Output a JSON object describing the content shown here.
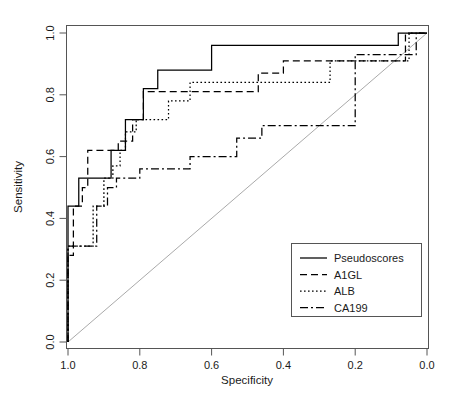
{
  "chart_data": {
    "type": "line",
    "title": "",
    "xlabel": "Specificity",
    "ylabel": "Sensitivity",
    "xlim": [
      1.0,
      0.0
    ],
    "ylim": [
      0.0,
      1.0
    ],
    "x_reversed": true,
    "grid": false,
    "legend_position": "bottom-right",
    "xticks": [
      "1.0",
      "0.8",
      "0.6",
      "0.4",
      "0.2",
      "0.0"
    ],
    "xtick_values": [
      1.0,
      0.8,
      0.6,
      0.4,
      0.2,
      0.0
    ],
    "yticks": [
      "0.0",
      "0.2",
      "0.4",
      "0.6",
      "0.8",
      "1.0"
    ],
    "ytick_values": [
      0.0,
      0.2,
      0.4,
      0.6,
      0.8,
      1.0
    ],
    "reference_line": {
      "name": "chance-diagonal",
      "from": [
        1.0,
        0.0
      ],
      "to": [
        0.0,
        1.0
      ],
      "color": "#aaaaaa"
    },
    "series": [
      {
        "name": "Pseudoscores",
        "style": "solid",
        "dasharray": "none",
        "color": "#000000",
        "points": [
          [
            1.0,
            0.0
          ],
          [
            1.0,
            0.44
          ],
          [
            0.97,
            0.44
          ],
          [
            0.97,
            0.53
          ],
          [
            0.88,
            0.53
          ],
          [
            0.88,
            0.62
          ],
          [
            0.84,
            0.62
          ],
          [
            0.84,
            0.72
          ],
          [
            0.79,
            0.72
          ],
          [
            0.79,
            0.82
          ],
          [
            0.75,
            0.82
          ],
          [
            0.75,
            0.88
          ],
          [
            0.6,
            0.88
          ],
          [
            0.6,
            0.96
          ],
          [
            0.08,
            0.96
          ],
          [
            0.08,
            1.0
          ],
          [
            0.0,
            1.0
          ]
        ]
      },
      {
        "name": "A1GL",
        "style": "dashed",
        "dasharray": "7,4",
        "color": "#000000",
        "points": [
          [
            1.0,
            0.0
          ],
          [
            1.0,
            0.28
          ],
          [
            0.985,
            0.28
          ],
          [
            0.985,
            0.44
          ],
          [
            0.96,
            0.44
          ],
          [
            0.96,
            0.5
          ],
          [
            0.945,
            0.5
          ],
          [
            0.945,
            0.62
          ],
          [
            0.86,
            0.62
          ],
          [
            0.86,
            0.65
          ],
          [
            0.82,
            0.65
          ],
          [
            0.82,
            0.72
          ],
          [
            0.79,
            0.72
          ],
          [
            0.79,
            0.81
          ],
          [
            0.47,
            0.81
          ],
          [
            0.47,
            0.87
          ],
          [
            0.4,
            0.87
          ],
          [
            0.4,
            0.91
          ],
          [
            0.06,
            0.91
          ],
          [
            0.06,
            1.0
          ],
          [
            0.0,
            1.0
          ]
        ]
      },
      {
        "name": "ALB",
        "style": "dotted",
        "dasharray": "1.6,2.4",
        "color": "#000000",
        "points": [
          [
            1.0,
            0.0
          ],
          [
            1.0,
            0.31
          ],
          [
            0.93,
            0.31
          ],
          [
            0.93,
            0.44
          ],
          [
            0.9,
            0.44
          ],
          [
            0.9,
            0.53
          ],
          [
            0.875,
            0.53
          ],
          [
            0.875,
            0.57
          ],
          [
            0.855,
            0.57
          ],
          [
            0.855,
            0.62
          ],
          [
            0.84,
            0.62
          ],
          [
            0.84,
            0.68
          ],
          [
            0.81,
            0.68
          ],
          [
            0.81,
            0.72
          ],
          [
            0.72,
            0.72
          ],
          [
            0.72,
            0.78
          ],
          [
            0.66,
            0.78
          ],
          [
            0.66,
            0.84
          ],
          [
            0.27,
            0.84
          ],
          [
            0.27,
            0.91
          ],
          [
            0.05,
            0.91
          ],
          [
            0.05,
            1.0
          ],
          [
            0.0,
            1.0
          ]
        ]
      },
      {
        "name": "CA199",
        "style": "dashdot",
        "dasharray": "8,3,2,3",
        "color": "#000000",
        "points": [
          [
            1.0,
            0.0
          ],
          [
            1.0,
            0.31
          ],
          [
            0.92,
            0.31
          ],
          [
            0.92,
            0.44
          ],
          [
            0.89,
            0.44
          ],
          [
            0.89,
            0.5
          ],
          [
            0.865,
            0.5
          ],
          [
            0.865,
            0.53
          ],
          [
            0.8,
            0.53
          ],
          [
            0.8,
            0.56
          ],
          [
            0.66,
            0.56
          ],
          [
            0.66,
            0.6
          ],
          [
            0.53,
            0.6
          ],
          [
            0.53,
            0.66
          ],
          [
            0.46,
            0.66
          ],
          [
            0.46,
            0.7
          ],
          [
            0.2,
            0.7
          ],
          [
            0.2,
            0.93
          ],
          [
            0.03,
            0.93
          ],
          [
            0.03,
            1.0
          ],
          [
            0.0,
            1.0
          ]
        ]
      }
    ]
  },
  "axes": {
    "x_title": "Specificity",
    "y_title": "Sensitivity",
    "x_tick_labels": [
      "1.0",
      "0.8",
      "0.6",
      "0.4",
      "0.2",
      "0.0"
    ],
    "y_tick_labels": [
      "0.0",
      "0.2",
      "0.4",
      "0.6",
      "0.8",
      "1.0"
    ]
  },
  "legend": {
    "items": [
      {
        "label": "Pseudoscores",
        "style": "solid"
      },
      {
        "label": "A1GL",
        "style": "dashed"
      },
      {
        "label": "ALB",
        "style": "dotted"
      },
      {
        "label": "CA199",
        "style": "dashdot"
      }
    ]
  }
}
